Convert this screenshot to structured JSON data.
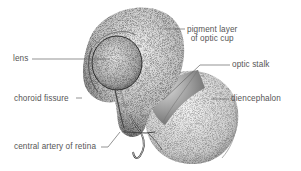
{
  "figure": {
    "labels": [
      {
        "id": "lens",
        "text": "lens"
      },
      {
        "id": "pigment-layer",
        "line1": "pigment layer",
        "line2": "of optic cup"
      },
      {
        "id": "optic-stalk",
        "text": "optic stalk"
      },
      {
        "id": "choroid-fissure",
        "text": "choroid fissure"
      },
      {
        "id": "diencephalon",
        "text": "diencephalon"
      },
      {
        "id": "central-artery",
        "text": "central artery of retina"
      }
    ]
  },
  "colors": {
    "background": "#ffffff",
    "stipple": "#3a3a3a",
    "label_text": "#555555",
    "leader_line": "#666666"
  }
}
